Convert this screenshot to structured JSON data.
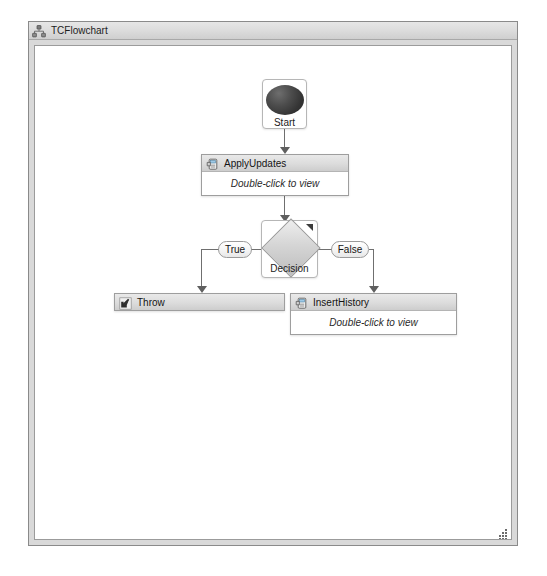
{
  "window": {
    "title": "TCFlowchart",
    "icon": "hierarchy-icon",
    "resize_grip": "resize-grip-icon"
  },
  "flowchart": {
    "nodes": [
      {
        "id": "start",
        "type": "start",
        "label": "Start",
        "icon": "filled-circle-icon"
      },
      {
        "id": "apply-updates",
        "type": "composite-activity",
        "label": "ApplyUpdates",
        "body_hint": "Double-click to view",
        "icon": "activity-icon"
      },
      {
        "id": "decision",
        "type": "decision",
        "label": "Decision",
        "icon": "diamond-icon",
        "corner_marker": "expand-corner-icon"
      },
      {
        "id": "throw",
        "type": "activity",
        "label": "Throw",
        "icon": "throw-arrow-icon"
      },
      {
        "id": "insert-history",
        "type": "composite-activity",
        "label": "InsertHistory",
        "body_hint": "Double-click to view",
        "icon": "activity-icon"
      }
    ],
    "edges": [
      {
        "id": "start-to-apply",
        "from": "start",
        "to": "apply-updates",
        "label": ""
      },
      {
        "id": "apply-to-decision",
        "from": "apply-updates",
        "to": "decision",
        "label": ""
      },
      {
        "id": "decision-true",
        "from": "decision",
        "to": "throw",
        "label": "True"
      },
      {
        "id": "decision-false",
        "from": "decision",
        "to": "insert-history",
        "label": "False"
      }
    ],
    "edge_labels": {
      "true": "True",
      "false": "False"
    }
  },
  "colors": {
    "frame_border": "#8a8a8a",
    "titlebar": "#dcdcdc",
    "canvas": "#ffffff",
    "node_header": "#dcdcdc",
    "connector": "#6f6f6f",
    "start_bullet": "#343434",
    "diamond": "#d5d5d5"
  }
}
